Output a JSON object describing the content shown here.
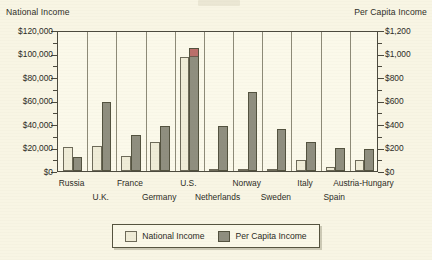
{
  "chart_data": {
    "type": "bar",
    "title": "",
    "subtitle": "",
    "grid": true,
    "legend_position": "bottom-center",
    "categories": [
      "Russia",
      "U.K.",
      "France",
      "Germany",
      "U.S.",
      "Netherlands",
      "Norway",
      "Sweden",
      "Italy",
      "Spain",
      "Austria-Hungary"
    ],
    "series": [
      {
        "name": "National Income",
        "axis": "left",
        "unit": "USD (millions)",
        "values": [
          20500,
          21000,
          12500,
          24500,
          97000,
          1000,
          800,
          1300,
          9000,
          3500,
          9000
        ]
      },
      {
        "name": "Per Capita Income",
        "axis": "right",
        "unit": "USD",
        "values": [
          120,
          590,
          305,
          385,
          1050,
          380,
          670,
          355,
          245,
          200,
          190
        ]
      }
    ],
    "left_axis": {
      "label": "National Income",
      "ylim": [
        0,
        120000
      ],
      "ticks": [
        0,
        20000,
        40000,
        60000,
        80000,
        100000,
        120000
      ],
      "tick_labels": [
        "$0",
        "$20,000",
        "$40,000",
        "$60,000",
        "$80,000",
        "$100,000",
        "$120,000"
      ]
    },
    "right_axis": {
      "label": "Per Capita Income",
      "ylim": [
        0,
        1200
      ],
      "ticks": [
        0,
        200,
        400,
        600,
        800,
        1000,
        1200
      ],
      "tick_labels": [
        "$0",
        "$200",
        "$400",
        "$600",
        "$800",
        "$1,000",
        "$1,200"
      ]
    },
    "xlabel": "",
    "annotations": [
      {
        "target": "U.S.",
        "series": "Per Capita Income",
        "note": "highlighted red cap on bar top"
      }
    ],
    "colors": {
      "national_income_fill": "#efecd7",
      "per_capita_fill": "#8f8e7f",
      "highlight_cap": "#bb6f6b",
      "plot_background": "#fbf9ea",
      "page_background": "#f8f5e4",
      "axis_line": "#4c4a3e",
      "gridline": "#8d8a77",
      "text": "#2c2c25"
    }
  },
  "axes": {
    "left_title": "National Income",
    "right_title": "Per Capita Income"
  },
  "legend": {
    "items": [
      {
        "label": "National Income",
        "swatch": "national"
      },
      {
        "label": "Per Capita Income",
        "swatch": "percapita"
      }
    ]
  }
}
